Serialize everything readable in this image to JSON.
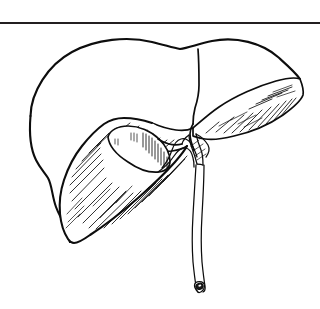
{
  "figure": {
    "title": "Liver with gallbladder and biliary tree",
    "subject": "liver",
    "view": "anterior-inferior oblique",
    "style": "black ink line drawing",
    "background_color": "#ffffff",
    "ink_color": "#0d0d0d",
    "rule_color": "#231f20",
    "canvas": {
      "width": 320,
      "height": 309
    },
    "has_text_labels": false,
    "label_text": ""
  },
  "top_rule": {
    "name": "horizontal-rule",
    "y": 22,
    "thickness": 2,
    "color": "#231f20"
  },
  "parts": [
    {
      "id": "liver-body",
      "label": "Liver (right lobe, diaphragmatic surface)",
      "shading": "none",
      "stroke_weight": "major"
    },
    {
      "id": "left-lateral-segment",
      "label": "Left lateral segment",
      "shading": "diagonal hatching",
      "stroke_weight": "mid"
    },
    {
      "id": "inferior-surface",
      "label": "Inferior (visceral) surface",
      "shading": "diagonal hatching",
      "stroke_weight": "mid"
    },
    {
      "id": "gallbladder",
      "label": "Gallbladder",
      "shading": "partial hatching on right flank",
      "stroke_weight": "mid"
    },
    {
      "id": "cystic-duct",
      "label": "Cystic duct",
      "shading": "none",
      "stroke_weight": "thin"
    },
    {
      "id": "common-hepatic-duct",
      "label": "Common hepatic duct",
      "shading": "none",
      "stroke_weight": "thin"
    },
    {
      "id": "common-bile-duct",
      "label": "Common bile duct",
      "shading": "none",
      "stroke_weight": "thin"
    },
    {
      "id": "duct-cut-end",
      "label": "Cut end of common bile duct",
      "shading": "solid dark lumen",
      "stroke_weight": "thin"
    },
    {
      "id": "falciform-ligament-fold",
      "label": "Falciform ligament fold",
      "shading": "none",
      "stroke_weight": "mid"
    }
  ]
}
